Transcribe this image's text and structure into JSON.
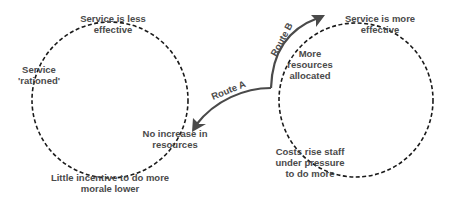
{
  "diagram": {
    "colors": {
      "circle_stroke": "#1a1a1a",
      "arrow": "#4a4a4a",
      "text": "#4a4a4a",
      "background": "#ffffff"
    },
    "left_cycle": {
      "name": "Route A cycle",
      "nodes": {
        "top": "Service is less effective",
        "top_line1": "Service is less",
        "top_line2": "effective",
        "left_line1": "Service",
        "left_line2": "'rationed'",
        "right_line1": "No increase in",
        "right_line2": "resources",
        "bottom_line1": "Little incentive to do more",
        "bottom_line2": "morale lower"
      }
    },
    "right_cycle": {
      "name": "Route B cycle",
      "nodes": {
        "top_line1": "Service is more",
        "top_line2": "effective",
        "left_line1": "More",
        "left_line2": "resources",
        "left_line3": "allocated",
        "bottom_line1": "Costs rise staff",
        "bottom_line2": "under pressure",
        "bottom_line3": "to do more"
      }
    },
    "arrows": {
      "route_a": "Route A",
      "route_b": "Route B"
    }
  }
}
